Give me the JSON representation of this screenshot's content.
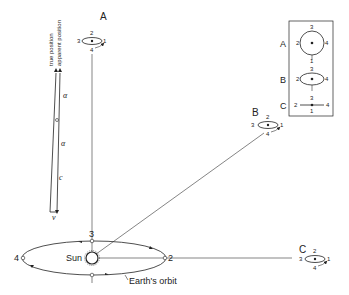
{
  "sun": {
    "label": "Sun"
  },
  "orbit": {
    "label": "Earth's orbit",
    "positions": [
      "1",
      "2",
      "3",
      "4"
    ]
  },
  "aberration_triangle": {
    "labels": {
      "true_position": "true position",
      "apparent_position": "apparent position",
      "alpha_top": "α",
      "alpha_bottom": "α",
      "c": "c",
      "v": "v"
    }
  },
  "stars": [
    {
      "id": "A",
      "label": "A",
      "description": "star at ecliptic pole",
      "points": [
        "1",
        "2",
        "3",
        "4"
      ]
    },
    {
      "id": "B",
      "label": "B",
      "description": "star at intermediate latitude",
      "points": [
        "1",
        "2",
        "3",
        "4"
      ]
    },
    {
      "id": "C",
      "label": "C",
      "description": "star in ecliptic plane",
      "points": [
        "1",
        "2",
        "3",
        "4"
      ]
    }
  ],
  "inset": {
    "rows": [
      {
        "label": "A",
        "shape": "circle",
        "top": "3",
        "left": "2",
        "right": "4",
        "bottom": "1"
      },
      {
        "label": "B",
        "shape": "ellipse",
        "top": "3",
        "left": "2",
        "right": "4",
        "bottom": "1"
      },
      {
        "label": "C",
        "shape": "line",
        "top": "3",
        "left": "2",
        "right": "4",
        "bottom": "1"
      }
    ]
  }
}
